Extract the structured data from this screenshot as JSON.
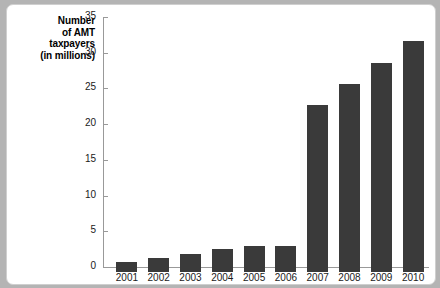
{
  "chart_data": {
    "type": "bar",
    "title": "",
    "xlabel": "",
    "ylabel": "Number of AMT taxpayers (in millions)",
    "ylabel_lines": [
      "Number",
      "of AMT",
      "taxpayers",
      "(in millions)"
    ],
    "categories": [
      "2001",
      "2002",
      "2003",
      "2004",
      "2005",
      "2006",
      "2007",
      "2008",
      "2009",
      "2010"
    ],
    "values": [
      1.4,
      2.0,
      2.5,
      3.2,
      3.6,
      3.7,
      23.4,
      26.3,
      29.3,
      32.4
    ],
    "ylim": [
      0,
      35
    ],
    "yticks": [
      0,
      5,
      10,
      15,
      20,
      25,
      30,
      35
    ],
    "ytick_labels": [
      "0",
      "5",
      "10",
      "15",
      "20",
      "25",
      "30",
      "35"
    ],
    "grid": false,
    "legend": null,
    "bar_color": "#3a3a3a",
    "axis_color": "#999999",
    "plot_background": "#ffffff",
    "page_background": "#b4b4b4"
  }
}
